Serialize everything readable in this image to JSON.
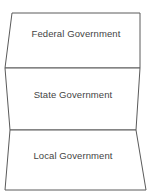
{
  "diagram": {
    "type": "layered-tier-diagram",
    "background_color": "#ffffff",
    "stroke_color": "#5a5a5a",
    "text_color": "#444444",
    "bands": [
      {
        "id": "federal",
        "label": "Federal Government",
        "order": 1,
        "label_x": 76,
        "label_y": 34,
        "points": "12,13 140,13 140,68 5,68"
      },
      {
        "id": "state",
        "label": "State Government",
        "order": 2,
        "label_x": 73,
        "label_y": 95,
        "points": "5,68 140,68 136,130 10,130"
      },
      {
        "id": "local",
        "label": "Local Government",
        "order": 3,
        "label_x": 73,
        "label_y": 156,
        "points": "10,130 136,130 146,190 5,190"
      }
    ]
  }
}
